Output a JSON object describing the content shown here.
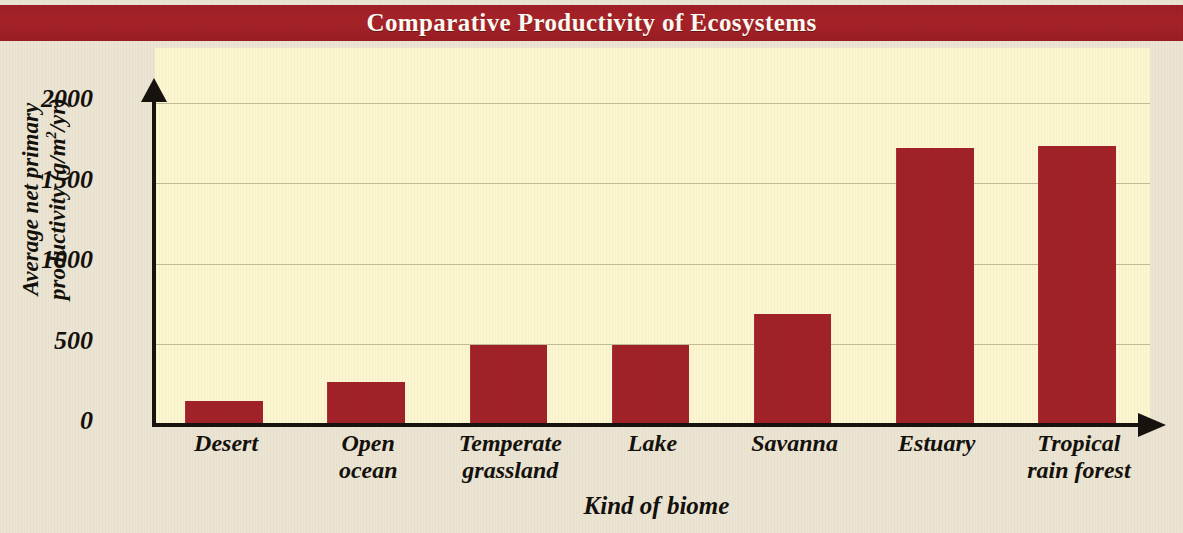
{
  "banner": {
    "title": "Comparative Productivity of Ecosystems",
    "background_color": "#a32028",
    "text_color": "#fdfaf2"
  },
  "figure": {
    "page_background": "#ebe4d2",
    "plot_background": "#fbf6cf",
    "gridline_color": "#b9b08a",
    "axis_color": "#16120e"
  },
  "chart_data": {
    "type": "bar",
    "title": "Comparative Productivity of Ecosystems",
    "xlabel": "Kind of biome",
    "ylabel": "Average net primary productivity (g/m2/yr)",
    "ylabel_line1": "Average net primary",
    "ylabel_line2_prefix": "productivity (g/m",
    "ylabel_line2_sup": "2",
    "ylabel_line2_suffix": "/yr)",
    "categories": [
      "Desert",
      "Open ocean",
      "Temperate grassland",
      "Lake",
      "Savanna",
      "Estuary",
      "Tropical rain forest"
    ],
    "category_lines": [
      [
        "Desert"
      ],
      [
        "Open",
        "ocean"
      ],
      [
        "Temperate",
        "grassland"
      ],
      [
        "Lake"
      ],
      [
        "Savanna"
      ],
      [
        "Estuary"
      ],
      [
        "Tropical",
        "rain forest"
      ]
    ],
    "values": [
      150,
      270,
      500,
      500,
      690,
      1720,
      1730
    ],
    "bar_color": "#a9242a",
    "ylim": [
      0,
      2000
    ],
    "yticks": [
      0,
      500,
      1000,
      1500,
      2000
    ],
    "ytick_labels": [
      "0",
      "500",
      "1000",
      "1500",
      "2000"
    ],
    "grid": true,
    "grid_axis": "y",
    "legend": "none"
  }
}
